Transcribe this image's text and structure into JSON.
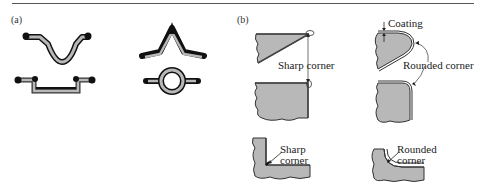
{
  "figure": {
    "panel_a": {
      "label": "(a)",
      "shapes": [
        "hat-channel-deep",
        "hat-channel-shallow",
        "peaked-strip",
        "ring-with-tabs"
      ]
    },
    "panel_b": {
      "label": "(b)",
      "annotations": {
        "sharp_corner_top": "Sharp corner",
        "coating": "Coating",
        "rounded_corner_top": "Rounded corner",
        "sharp_corner_bottom_line1": "Sharp",
        "sharp_corner_bottom_line2": "corner",
        "rounded_corner_bottom_line1": "Rounded",
        "rounded_corner_bottom_line2": "corner"
      }
    },
    "colors": {
      "fill_gray": "#b8b8b8",
      "coating_black": "#111111",
      "outline": "#333333",
      "rule": "#555555"
    }
  }
}
